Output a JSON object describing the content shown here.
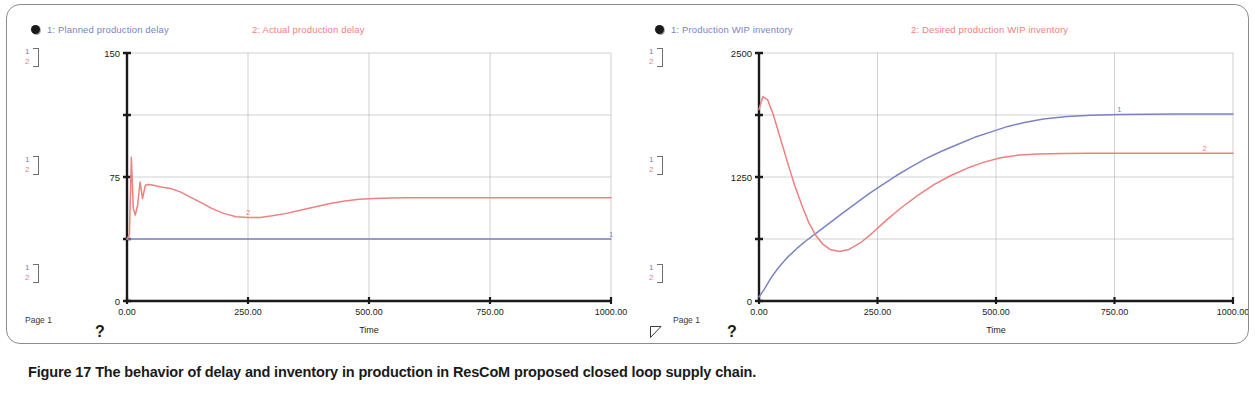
{
  "figure": {
    "caption_lead": "Figure 17",
    "caption_text": "The behavior of delay and inventory in production in ResCoM proposed closed loop supply chain."
  },
  "colors": {
    "series1": "#7b83c4",
    "series2": "#ef8080",
    "axis": "#1a1a1a",
    "grid": "#9a9a9a",
    "frame": "#8d8d8d"
  },
  "panels": [
    {
      "id": "left",
      "page_label": "Page 1",
      "help_glyph": "?",
      "legend": [
        {
          "marker": "1",
          "label": "1: Planned production  delay",
          "color": "#7b83c4"
        },
        {
          "marker": "2",
          "label": "2: Actual production  delay",
          "color": "#ef8080"
        }
      ],
      "scale_markers": [
        "1",
        "2"
      ],
      "chart_data": {
        "type": "line",
        "title": "Actual production delay Vs. Planned production delay",
        "xlabel": "Time",
        "ylabel": "",
        "xlim": [
          0,
          1000
        ],
        "ylim": [
          0,
          150
        ],
        "xticks": [
          0,
          250,
          500,
          750,
          1000
        ],
        "xtick_labels": [
          "0.00",
          "250.00",
          "500.00",
          "750.00",
          "1000.00"
        ],
        "yticks": [
          0,
          37.5,
          75,
          112.5,
          150
        ],
        "ytick_labels": [
          "0",
          "",
          "75",
          "",
          "150"
        ],
        "grid": true,
        "legend_position": "top",
        "series": [
          {
            "name": "Planned production  delay",
            "marker": "1",
            "color": "#7b83c4",
            "inline_label_x": 560,
            "x": [
              0,
              10,
              1000
            ],
            "values": [
              37.5,
              37.5,
              37.5
            ]
          },
          {
            "name": "Actual production  delay",
            "marker": "2",
            "color": "#ef8080",
            "inline_label_x": 240,
            "x": [
              0,
              5,
              9,
              13,
              17,
              22,
              27,
              32,
              38,
              45,
              55,
              70,
              90,
              110,
              130,
              150,
              175,
              200,
              225,
              250,
              275,
              300,
              330,
              360,
              390,
              420,
              450,
              480,
              510,
              545,
              580,
              620,
              700,
              800,
              900,
              1000
            ],
            "values": [
              37.5,
              40,
              87,
              56,
              52,
              58,
              72,
              62,
              70,
              70.5,
              70,
              69,
              68,
              66,
              63,
              60,
              56,
              53,
              51,
              50.5,
              50.5,
              51.5,
              53,
              55,
              57,
              59,
              60.5,
              61.5,
              62,
              62.3,
              62.5,
              62.5,
              62.5,
              62.5,
              62.5,
              62.5
            ]
          }
        ]
      }
    },
    {
      "id": "right",
      "page_label": "Page 1",
      "help_glyph": "?",
      "legend": [
        {
          "marker": "1",
          "label": "1: Production WIP inventory",
          "color": "#7b83c4"
        },
        {
          "marker": "2",
          "label": "2: Desired production  WIP inventory",
          "color": "#ef8080"
        }
      ],
      "scale_markers": [
        "1",
        "2"
      ],
      "chart_data": {
        "type": "line",
        "title": "Behavior of inventory",
        "xlabel": "Time",
        "ylabel": "",
        "xlim": [
          0,
          1000
        ],
        "ylim": [
          0,
          2500
        ],
        "xticks": [
          0,
          250,
          500,
          750,
          1000
        ],
        "xtick_labels": [
          "0.00",
          "250.00",
          "500.00",
          "750.00",
          "1000.00"
        ],
        "yticks": [
          0,
          625,
          1250,
          1875,
          2500
        ],
        "ytick_labels": [
          "0",
          "",
          "1250",
          "",
          "2500"
        ],
        "grid": true,
        "legend_position": "top",
        "series": [
          {
            "name": "Production WIP inventory",
            "marker": "1",
            "color": "#7b83c4",
            "inline_label_x": 790,
            "x": [
              0,
              10,
              25,
              40,
              60,
              80,
              100,
              125,
              150,
              175,
              200,
              230,
              260,
              290,
              320,
              350,
              385,
              420,
              455,
              490,
              525,
              560,
              600,
              650,
              700,
              760,
              820,
              880,
              940,
              1000
            ],
            "values": [
              40,
              110,
              230,
              330,
              440,
              530,
              610,
              700,
              790,
              880,
              970,
              1075,
              1170,
              1265,
              1350,
              1430,
              1510,
              1580,
              1650,
              1705,
              1760,
              1800,
              1835,
              1860,
              1872,
              1880,
              1882,
              1884,
              1885,
              1885
            ]
          },
          {
            "name": "Desired production  WIP inventory",
            "marker": "2",
            "color": "#ef8080",
            "inline_label_x": 915,
            "x": [
              0,
              8,
              18,
              30,
              45,
              60,
              75,
              90,
              105,
              120,
              135,
              150,
              170,
              190,
              215,
              240,
              270,
              300,
              335,
              370,
              405,
              440,
              475,
              510,
              550,
              590,
              640,
              700,
              780,
              860,
              940,
              1000
            ],
            "values": [
              1930,
              2060,
              2030,
              1880,
              1640,
              1400,
              1170,
              970,
              790,
              660,
              570,
              520,
              500,
              520,
              590,
              690,
              820,
              940,
              1065,
              1175,
              1265,
              1340,
              1400,
              1445,
              1472,
              1482,
              1488,
              1490,
              1490,
              1490,
              1490,
              1490
            ]
          }
        ]
      }
    }
  ]
}
